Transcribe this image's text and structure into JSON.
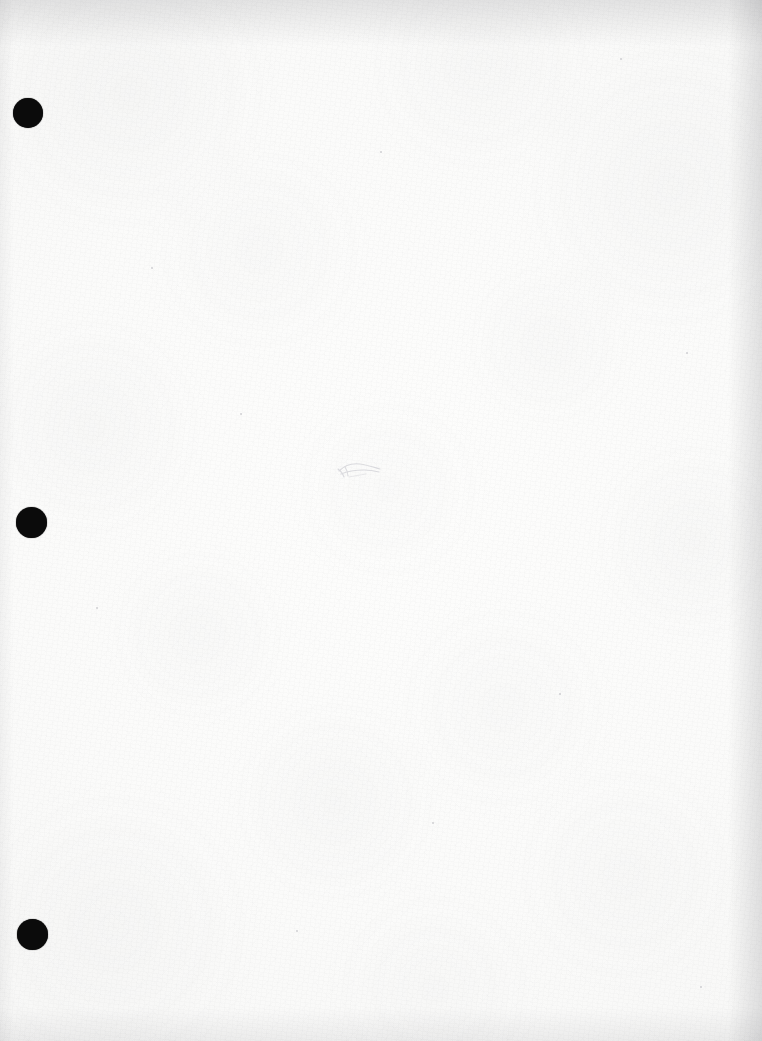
{
  "page": {
    "kind": "scanned-document",
    "width_px": 762,
    "height_px": 1041,
    "paper_color": "#fbfbfa",
    "edge_shadow_color": "#b2b2b6",
    "visible_text": "",
    "body_text": ""
  },
  "punch_holes": {
    "count": 3,
    "color": "#0b0b0b",
    "items": [
      {
        "label": "top-hole",
        "cx": 28,
        "cy": 113,
        "d": 30
      },
      {
        "label": "middle-hole",
        "cx": 31,
        "cy": 522,
        "d": 31
      },
      {
        "label": "bottom-hole",
        "cx": 32,
        "cy": 934,
        "d": 31
      }
    ]
  },
  "marks": {
    "pencil_mark": {
      "label": "faint pencil squiggle",
      "x": 336,
      "y": 458,
      "w": 48,
      "h": 28,
      "color": "#d8d8dc"
    }
  },
  "specks": [
    {
      "x": 151,
      "y": 267,
      "d": 2
    },
    {
      "x": 380,
      "y": 151,
      "d": 2
    },
    {
      "x": 620,
      "y": 58,
      "d": 2
    },
    {
      "x": 240,
      "y": 413,
      "d": 2
    },
    {
      "x": 96,
      "y": 607,
      "d": 2
    },
    {
      "x": 559,
      "y": 693,
      "d": 2
    },
    {
      "x": 432,
      "y": 822,
      "d": 2
    },
    {
      "x": 700,
      "y": 986,
      "d": 2
    },
    {
      "x": 296,
      "y": 930,
      "d": 2
    },
    {
      "x": 686,
      "y": 352,
      "d": 2
    }
  ]
}
